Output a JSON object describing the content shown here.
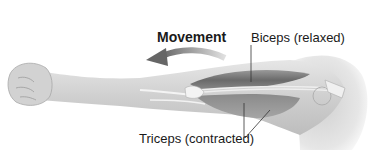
{
  "diagram": {
    "title": "Movement",
    "labels": {
      "biceps": "Biceps (relaxed)",
      "triceps": "Triceps (contracted)"
    },
    "arrow": {
      "direction": "left",
      "color": "#6e6e6e"
    },
    "colors": {
      "skin": "#d9d9d9",
      "skin_shadow": "#b5b5b5",
      "biceps_muscle": "#7a7a7a",
      "triceps_muscle": "#8c8c8c",
      "bone": "#ededed",
      "text": "#1a1a1a",
      "leader_line": "#333333"
    }
  }
}
